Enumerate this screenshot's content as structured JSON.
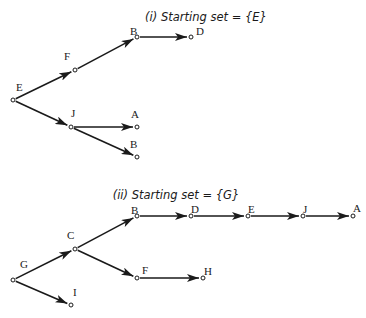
{
  "diagrams": [
    {
      "title": "(i) Starting set = {E}",
      "title_pos": [
        206,
        21
      ],
      "nodes": [
        {
          "id": "E",
          "label": "E",
          "x": 13,
          "y": 100,
          "lx": 16,
          "ly": 91
        },
        {
          "id": "F",
          "label": "F",
          "x": 75,
          "y": 70,
          "lx": 64,
          "ly": 60
        },
        {
          "id": "B1",
          "label": "B",
          "x": 137,
          "y": 37,
          "lx": 130,
          "ly": 35
        },
        {
          "id": "D",
          "label": "D",
          "x": 191,
          "y": 37,
          "lx": 196,
          "ly": 35
        },
        {
          "id": "J",
          "label": "J",
          "x": 71,
          "y": 127,
          "lx": 71,
          "ly": 117
        },
        {
          "id": "A",
          "label": "A",
          "x": 137,
          "y": 127,
          "lx": 131,
          "ly": 118
        },
        {
          "id": "B2",
          "label": "B",
          "x": 137,
          "y": 157,
          "lx": 130,
          "ly": 148
        }
      ],
      "edges": [
        [
          "E",
          "F"
        ],
        [
          "F",
          "B1"
        ],
        [
          "B1",
          "D"
        ],
        [
          "E",
          "J"
        ],
        [
          "J",
          "A"
        ],
        [
          "J",
          "B2"
        ]
      ]
    },
    {
      "title": "(ii) Starting set = {G}",
      "title_pos": [
        176,
        199
      ],
      "nodes": [
        {
          "id": "G",
          "label": "G",
          "x": 13,
          "y": 280,
          "lx": 20,
          "ly": 268
        },
        {
          "id": "C",
          "label": "C",
          "x": 75,
          "y": 249,
          "lx": 67,
          "ly": 239
        },
        {
          "id": "B",
          "label": "B",
          "x": 137,
          "y": 216,
          "lx": 131,
          "ly": 214
        },
        {
          "id": "D",
          "label": "D",
          "x": 191,
          "y": 216,
          "lx": 191,
          "ly": 213
        },
        {
          "id": "E",
          "label": "E",
          "x": 248,
          "y": 216,
          "lx": 248,
          "ly": 213
        },
        {
          "id": "J",
          "label": "J",
          "x": 303,
          "y": 216,
          "lx": 303,
          "ly": 213
        },
        {
          "id": "A",
          "label": "A",
          "x": 353,
          "y": 216,
          "lx": 353,
          "ly": 212
        },
        {
          "id": "F",
          "label": "F",
          "x": 137,
          "y": 278,
          "lx": 142,
          "ly": 274
        },
        {
          "id": "H",
          "label": "H",
          "x": 203,
          "y": 278,
          "lx": 204,
          "ly": 275
        },
        {
          "id": "I",
          "label": "I",
          "x": 71,
          "y": 305,
          "lx": 73,
          "ly": 296
        }
      ],
      "edges": [
        [
          "G",
          "C"
        ],
        [
          "C",
          "B"
        ],
        [
          "B",
          "D"
        ],
        [
          "D",
          "E"
        ],
        [
          "E",
          "J"
        ],
        [
          "J",
          "A"
        ],
        [
          "C",
          "F"
        ],
        [
          "F",
          "H"
        ],
        [
          "G",
          "I"
        ]
      ]
    }
  ]
}
